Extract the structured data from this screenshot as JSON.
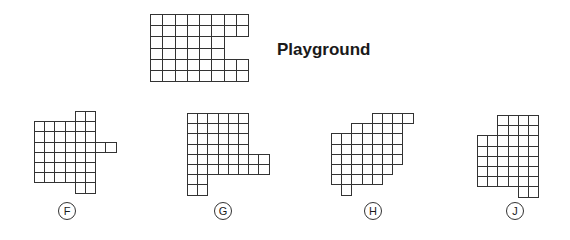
{
  "title": "Playground",
  "colors": {
    "line": "#333333",
    "background": "#ffffff"
  },
  "playground": {
    "origin": [
      150,
      14
    ],
    "cell_w": 12.25,
    "cell_h": 11.2,
    "rows": [
      [
        0,
        7
      ],
      [
        0,
        7
      ],
      [
        0,
        5
      ],
      [
        0,
        5
      ],
      [
        0,
        7
      ],
      [
        0,
        7
      ]
    ]
  },
  "options": [
    {
      "label": "F",
      "label_center": [
        67,
        211
      ],
      "origin": [
        34,
        111
      ],
      "cell": 10.2,
      "rows": [
        [
          [
            4,
            5
          ]
        ],
        [
          [
            0,
            5
          ]
        ],
        [
          [
            0,
            5
          ]
        ],
        [
          [
            0,
            7
          ]
        ],
        [
          [
            0,
            5
          ]
        ],
        [
          [
            0,
            5
          ]
        ],
        [
          [
            0,
            5
          ]
        ],
        [
          [
            4,
            5
          ]
        ]
      ]
    },
    {
      "label": "G",
      "label_center": [
        223,
        211
      ],
      "origin": [
        187,
        113
      ],
      "cell": 10.2,
      "rows": [
        [
          [
            0,
            5
          ]
        ],
        [
          [
            0,
            5
          ]
        ],
        [
          [
            0,
            5
          ]
        ],
        [
          [
            0,
            5
          ]
        ],
        [
          [
            0,
            7
          ]
        ],
        [
          [
            0,
            7
          ]
        ],
        [
          [
            0,
            1
          ]
        ],
        [
          [
            0,
            1
          ]
        ]
      ]
    },
    {
      "label": "H",
      "label_center": [
        373,
        211
      ],
      "origin": [
        331,
        113
      ],
      "cell": 10.2,
      "rows": [
        [
          [
            4,
            7
          ]
        ],
        [
          [
            2,
            6
          ]
        ],
        [
          [
            0,
            6
          ]
        ],
        [
          [
            0,
            6
          ]
        ],
        [
          [
            0,
            6
          ]
        ],
        [
          [
            0,
            5
          ]
        ],
        [
          [
            0,
            4
          ]
        ],
        [
          [
            1,
            1
          ]
        ]
      ]
    },
    {
      "label": "J",
      "label_center": [
        515,
        211
      ],
      "origin": [
        477,
        115
      ],
      "cell": 10.2,
      "rows": [
        [
          [
            2,
            5
          ]
        ],
        [
          [
            2,
            5
          ]
        ],
        [
          [
            0,
            5
          ]
        ],
        [
          [
            0,
            5
          ]
        ],
        [
          [
            0,
            5
          ]
        ],
        [
          [
            0,
            5
          ]
        ],
        [
          [
            0,
            5
          ]
        ],
        [
          [
            4,
            5
          ]
        ]
      ]
    }
  ]
}
